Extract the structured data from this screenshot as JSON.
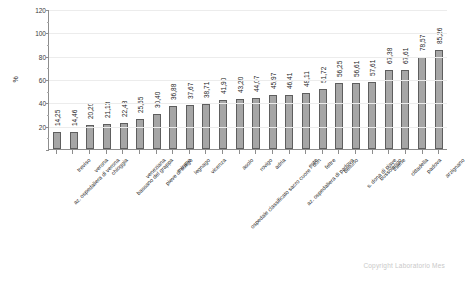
{
  "chart_data": {
    "type": "bar",
    "title": "",
    "subtitle": "",
    "xlabel": "",
    "ylabel": "%",
    "ylim": [
      0,
      120
    ],
    "yticks": [
      0,
      20,
      40,
      60,
      80,
      100,
      120
    ],
    "ytick_labels": [
      "0",
      "20",
      "40",
      "60",
      "80",
      "100",
      "120"
    ],
    "grid": true,
    "legend": null,
    "bar_color": "#a6a6a6",
    "bar_border_color": "#5e5e5e",
    "categories": [
      "az. ospedaliera di verona",
      "treviso",
      "verona",
      "chioggia",
      "bassano del grappa",
      "veneziana",
      "pieve di soligo",
      "mirano",
      "legnago",
      "vicenza",
      "ospedale classificato sacro cuore - don",
      "asolo",
      "rovigo",
      "adria",
      "az. ospedaliera di padova",
      "este",
      "feltre",
      "belluno",
      "s. dona di piave",
      "bussolengo",
      "thiene",
      "cittadella",
      "padova",
      "arzignano"
    ],
    "values": [
      14.25,
      14.46,
      20.2,
      21.13,
      22.48,
      25.55,
      30.4,
      36.88,
      37.67,
      38.71,
      41.9,
      43.2,
      44.07,
      45.97,
      46.41,
      48.11,
      51.72,
      56.25,
      56.61,
      57.61,
      67.38,
      67.61,
      78.57,
      85.26
    ],
    "value_labels": [
      "14,25",
      "14,46",
      "20,20",
      "21,13",
      "22,48",
      "25,55",
      "30,40",
      "36,88",
      "37,67",
      "38,71",
      "41,90",
      "43,20",
      "44,07",
      "45,97",
      "46,41",
      "48,11",
      "51,72",
      "56,25",
      "56,61",
      "57,61",
      "67,38",
      "67,61",
      "78,57",
      "85,26"
    ]
  },
  "watermark": {
    "text": "Copyright Laboratorio Mes"
  }
}
